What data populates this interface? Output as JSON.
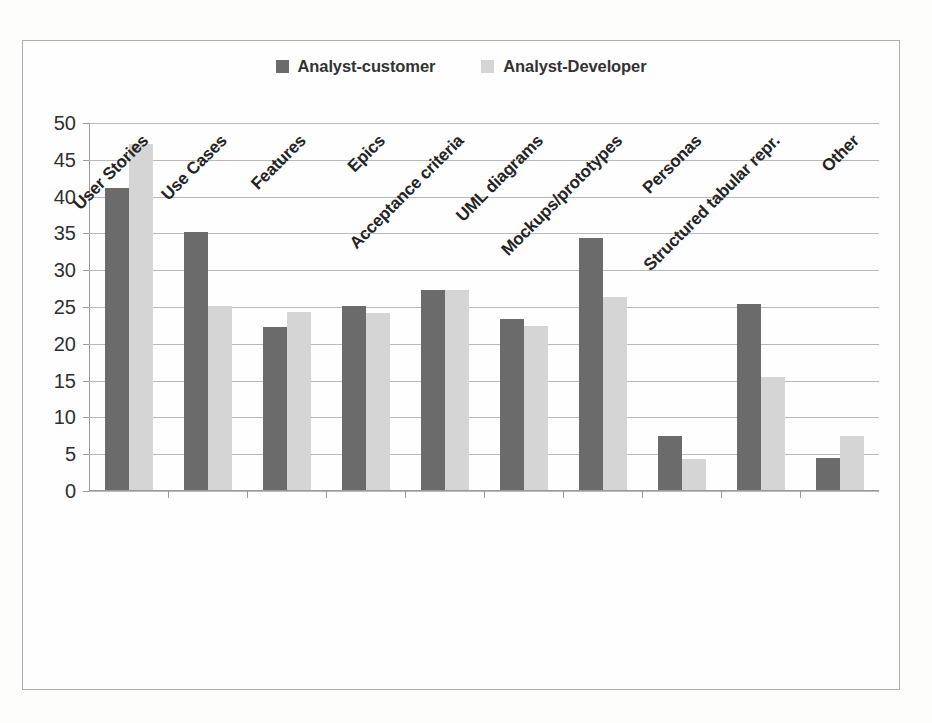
{
  "chart_data": {
    "type": "bar",
    "title": "",
    "xlabel": "",
    "ylabel": "",
    "ylim": [
      0,
      50
    ],
    "ytick_step": 5,
    "yticks": [
      "50",
      "45",
      "40",
      "35",
      "30",
      "25",
      "20",
      "15",
      "10",
      "5",
      "0"
    ],
    "grid": true,
    "legend_position": "top-center",
    "categories": [
      "User Stories",
      "Use Cases",
      "Features",
      "Epics",
      "Acceptance criteria",
      "UML diagrams",
      "Mockups/prototypes",
      "Personas",
      "Structured tabular repr.",
      "Other"
    ],
    "series": [
      {
        "name": "Analyst-customer",
        "color": "#6b6b6b",
        "values": [
          41.0,
          35.0,
          22.2,
          25.0,
          27.2,
          23.2,
          34.3,
          7.3,
          25.3,
          4.3
        ]
      },
      {
        "name": "Analyst-Developer",
        "color": "#d5d5d5",
        "values": [
          47.0,
          25.0,
          24.2,
          24.1,
          27.2,
          22.3,
          26.2,
          4.2,
          15.4,
          7.3
        ]
      }
    ]
  },
  "legend": {
    "items": [
      {
        "label": "Analyst-customer",
        "color": "#6b6b6b",
        "icon": "square-swatch-icon"
      },
      {
        "label": "Analyst-Developer",
        "color": "#d5d5d5",
        "icon": "square-swatch-icon"
      }
    ]
  }
}
